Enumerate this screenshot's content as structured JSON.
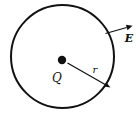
{
  "diagram": {
    "type": "physics-gauss-law-figure",
    "labels": {
      "charge": "Q",
      "radius": "r",
      "field": "E"
    },
    "colors": {
      "line": "#111111",
      "background": "#ffffff"
    }
  }
}
